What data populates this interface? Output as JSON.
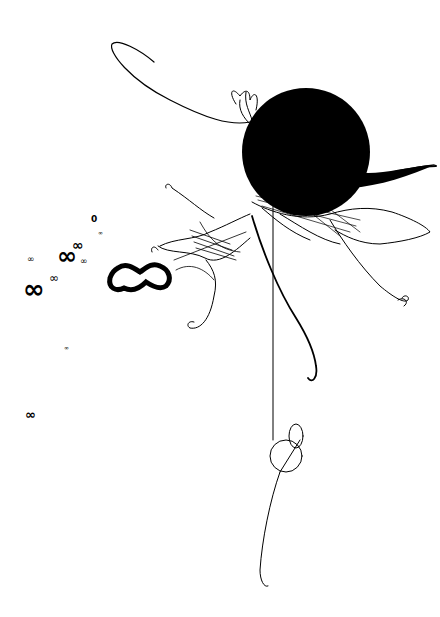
{
  "artwork": {
    "kind": "abstract generative ink drawing",
    "background": "#ffffff",
    "ink": "#000000",
    "elements": {
      "sphere": {
        "cx": 306,
        "cy": 152,
        "r": 64
      },
      "glyphs": [
        {
          "text": "0",
          "x": 91,
          "y": 215,
          "size": 9
        },
        {
          "text": "∞",
          "x": 98,
          "y": 230,
          "size": 6
        },
        {
          "text": "∞",
          "x": 27,
          "y": 255,
          "size": 9
        },
        {
          "text": "∞",
          "x": 72,
          "y": 243,
          "size": 14
        },
        {
          "text": "∞",
          "x": 57,
          "y": 250,
          "size": 24
        },
        {
          "text": "∞",
          "x": 80,
          "y": 258,
          "size": 9
        },
        {
          "text": "∞",
          "x": 49,
          "y": 275,
          "size": 12
        },
        {
          "text": "∞",
          "x": 23,
          "y": 280,
          "size": 26
        },
        {
          "text": "∞",
          "x": 64,
          "y": 347,
          "size": 6
        },
        {
          "text": "∞",
          "x": 25,
          "y": 412,
          "size": 13
        }
      ],
      "big_wave_glyph": {
        "x": 107,
        "y": 262,
        "w": 68,
        "h": 28
      }
    }
  }
}
